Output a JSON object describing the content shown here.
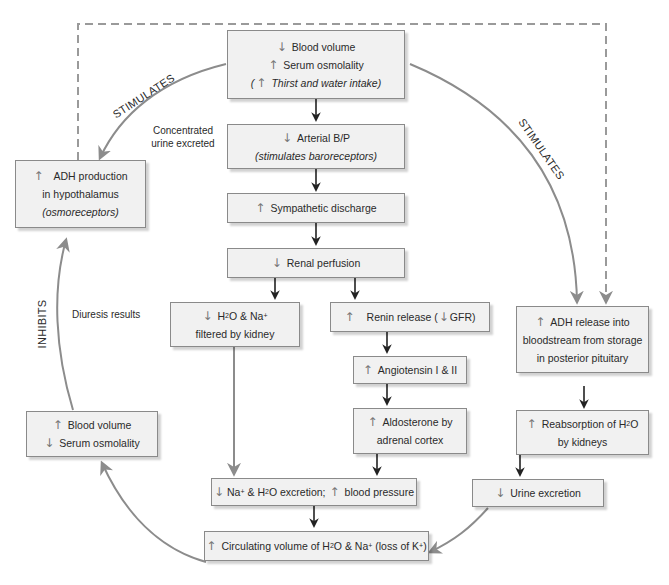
{
  "diagram": {
    "type": "physiology-feedback-flowchart",
    "colors": {
      "box_fill": "#f1f1f1",
      "box_border": "#8a8a8a",
      "main_arrow": "#222222",
      "loop_arrow": "#8c8c8c",
      "dashed_line": "#9a9a9a",
      "up_down_arrow": "#777777"
    }
  },
  "nodes": {
    "trigger": {
      "line1_arrow": "↓",
      "line1": "Blood volume",
      "line2_arrow": "↑",
      "line2": "Serum osmolality",
      "line3_prefix": "(",
      "line3_arrow": "↑",
      "line3": "Thirst and water intake)"
    },
    "arterial_bp": {
      "arrow": "↓",
      "line1": "Arterial B/P",
      "line2": "(stimulates baroreceptors)"
    },
    "sympathetic": {
      "arrow": "↑",
      "text": "Sympathetic discharge"
    },
    "renal_perfusion": {
      "arrow": "↓",
      "text": "Renal perfusion"
    },
    "h2o_filtered": {
      "arrow": "↓",
      "line1_a": "H",
      "line1_sub": "2",
      "line1_b": "O & Na",
      "line1_sup": "+",
      "line2": "filtered by kidney"
    },
    "renin": {
      "arrow": "↑",
      "text_a": "Renin release (",
      "inline_arrow": "↓",
      "text_b": "GFR)"
    },
    "angiotensin": {
      "arrow": "↑",
      "text": "Angiotensin I & II"
    },
    "aldosterone": {
      "arrow": "↑",
      "line1": "Aldosterone by",
      "line2": "adrenal cortex"
    },
    "excretion_bp": {
      "arrow": "↓",
      "text_a": "Na",
      "sup1": "+",
      "text_b": " & H",
      "sub1": "2",
      "text_c": "O excretion;",
      "arrow2": "↑",
      "text_d": "blood pressure"
    },
    "circulating": {
      "arrow": "↑",
      "text_a": "Circulating volume of H",
      "sub1": "2",
      "text_b": "O & Na",
      "sup1": "+",
      "text_c": " (loss of K",
      "sup2": "+",
      "text_d": ")"
    },
    "adh_production": {
      "arrow": "↑",
      "line1": "ADH production",
      "line2": "in hypothalamus",
      "line3": "(osmoreceptors)"
    },
    "adh_release": {
      "arrow": "↑",
      "line1": "ADH release into",
      "line2": "bloodstream from storage",
      "line3": "in posterior pituitary"
    },
    "reabsorption": {
      "arrow": "↑",
      "line1_a": "Reabsorption of H",
      "line1_sub": "2",
      "line1_b": "O",
      "line2": "by kidneys"
    },
    "urine_excretion": {
      "arrow": "↓",
      "text": "Urine excretion"
    },
    "feedback_result": {
      "line1_arrow": "↑",
      "line1": "Blood volume",
      "line2_arrow": "↓",
      "line2": "Serum osmolality"
    }
  },
  "labels": {
    "stimulates_left": "STIMULATES",
    "stimulates_right": "STIMULATES",
    "inhibits": "INHIBITS",
    "concentrated_line1": "Concentrated",
    "concentrated_line2": "urine excreted",
    "diuresis": "Diuresis results"
  }
}
